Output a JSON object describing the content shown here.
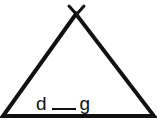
{
  "worksheet": {
    "shape": "teepee",
    "word": {
      "first_letter": "d",
      "missing_letter": "",
      "last_letter": "g"
    },
    "colors": {
      "stroke": "#111111",
      "background": "#ffffff"
    }
  }
}
